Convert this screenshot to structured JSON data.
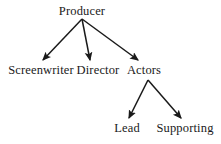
{
  "diagram": {
    "type": "tree-hierarchy",
    "background_color": "#ffffff",
    "line_color": "#1a1a1a",
    "text_color": "#1a1a1a",
    "nodes": [
      {
        "id": "producer",
        "label": "Producer",
        "level": 0,
        "cx": 82,
        "cy": 11
      },
      {
        "id": "screenwriter",
        "label": "Screenwriter",
        "level": 1,
        "cx": 41,
        "cy": 70
      },
      {
        "id": "director",
        "label": "Director",
        "level": 1,
        "cx": 98,
        "cy": 70
      },
      {
        "id": "actors",
        "label": "Actors",
        "level": 1,
        "cx": 144,
        "cy": 70
      },
      {
        "id": "lead",
        "label": "Lead",
        "level": 2,
        "cx": 127,
        "cy": 128
      },
      {
        "id": "supporting",
        "label": "Supporting",
        "level": 2,
        "cx": 185,
        "cy": 128
      }
    ],
    "edges": [
      {
        "id": "edge-producer-screenwriter",
        "from": "producer",
        "to": "screenwriter",
        "x1": 82,
        "y1": 19,
        "x2": 43,
        "y2": 60,
        "arrow": true
      },
      {
        "id": "edge-producer-director",
        "from": "producer",
        "to": "director",
        "x1": 82,
        "y1": 19,
        "x2": 90,
        "y2": 60,
        "arrow": true
      },
      {
        "id": "edge-producer-actors",
        "from": "producer",
        "to": "actors",
        "x1": 82,
        "y1": 19,
        "x2": 138,
        "y2": 60,
        "arrow": true
      },
      {
        "id": "edge-actors-lead",
        "from": "actors",
        "to": "lead",
        "x1": 148,
        "y1": 80,
        "x2": 129,
        "y2": 118,
        "arrow": true
      },
      {
        "id": "edge-actors-supporting",
        "from": "actors",
        "to": "supporting",
        "x1": 148,
        "y1": 80,
        "x2": 181,
        "y2": 118,
        "arrow": true
      }
    ]
  }
}
